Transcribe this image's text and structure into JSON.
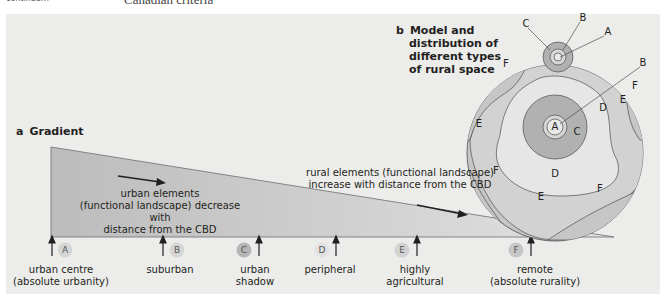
{
  "header": {
    "left_fragment": "continuum",
    "right_fragment": "Canadian criteria"
  },
  "gradient": {
    "letter": "a",
    "title": "Gradient",
    "urban_text": [
      "urban elements",
      "(functional landscape) decrease with",
      "distance from the CBD"
    ],
    "rural_text": [
      "rural elements (functional landscape)",
      "increase with distance from the CBD"
    ],
    "stages": [
      {
        "code": "A",
        "label_line1": "urban centre",
        "label_line2": "(absolute urbanity)"
      },
      {
        "code": "B",
        "label_line1": "suburban",
        "label_line2": ""
      },
      {
        "code": "C",
        "label_line1": "urban",
        "label_line2": "shadow"
      },
      {
        "code": "D",
        "label_line1": "peripheral",
        "label_line2": ""
      },
      {
        "code": "E",
        "label_line1": "highly",
        "label_line2": "agricultural"
      },
      {
        "code": "F",
        "label_line1": "remote",
        "label_line2": "(absolute rurality)"
      }
    ]
  },
  "model": {
    "letter": "b",
    "title_lines": [
      "Model and",
      "distribution of",
      "different types",
      "of rural space"
    ],
    "callouts": {
      "C_top": "C",
      "B_top": "B",
      "A_top": "A",
      "B_right": "B"
    },
    "zone_labels": {
      "F_upper_left": "F",
      "E_left": "E",
      "F_lower_left": "F",
      "A_center": "A",
      "C_center": "C",
      "D_right": "D",
      "E_right": "E",
      "F_right": "F",
      "D_bottom": "D",
      "E_bottom": "E",
      "F_bottom_right": "F"
    }
  },
  "colors": {
    "panel_bg": "#ececeb",
    "triangle_dark": "#bdbdbd",
    "triangle_light": "#dcdcdc",
    "zone_C": "#b1b1b1",
    "zone_D": "#e6e6e6",
    "zone_E": "#d2d2d2",
    "zone_F": "#c6c6c6",
    "line": "#4d4d4d",
    "badge": "#d3d3d3",
    "badge_dark": "#b4b4b4"
  }
}
